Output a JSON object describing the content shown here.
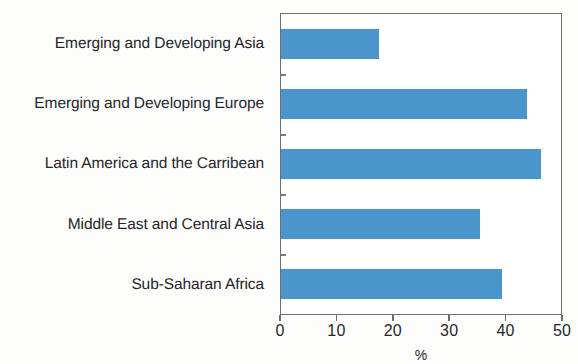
{
  "chart_data": {
    "type": "bar",
    "orientation": "horizontal",
    "title": "",
    "subtitle": "",
    "xlabel": "%",
    "ylabel": "",
    "xlim": [
      0,
      50
    ],
    "xticks": [
      0,
      10,
      20,
      30,
      40,
      50
    ],
    "xtick_labels": [
      "0",
      "10",
      "20",
      "30",
      "40",
      "50"
    ],
    "grid": false,
    "legend": false,
    "bar_color": "#4a95cc",
    "axis_color": "#6e6e70",
    "background": "#ffffff",
    "categories": [
      "Emerging and Developing Asia",
      "Emerging and Developing Europe",
      "Latin America and the Carribean",
      "Middle East and Central Asia",
      "Sub-Saharan Africa"
    ],
    "values": [
      17.5,
      44,
      46.5,
      35.5,
      39.5
    ],
    "series": [
      {
        "name": "",
        "values": [
          17.5,
          44,
          46.5,
          35.5,
          39.5
        ]
      }
    ]
  }
}
